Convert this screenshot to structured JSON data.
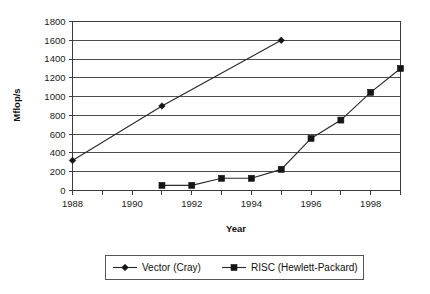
{
  "chart_data": {
    "type": "line",
    "title": "",
    "xlabel": "Year",
    "ylabel": "Mflop/s",
    "xlim": [
      1988,
      1999
    ],
    "ylim": [
      0,
      1800
    ],
    "ytick_step": 200,
    "xtick_step": 1,
    "x_tick_labels": [
      "1988",
      "1990",
      "1992",
      "1994",
      "1996",
      "1998"
    ],
    "x_tick_values": [
      1988,
      1990,
      1992,
      1994,
      1996,
      1998
    ],
    "y_tick_labels": [
      "0",
      "200",
      "400",
      "600",
      "800",
      "1000",
      "1200",
      "1400",
      "1600",
      "1800"
    ],
    "y_tick_values": [
      0,
      200,
      400,
      600,
      800,
      1000,
      1200,
      1400,
      1600,
      1800
    ],
    "grid": "horizontal",
    "legend_position": "bottom",
    "series": [
      {
        "name": "Vector (Cray)",
        "marker": "diamond",
        "color": "#151515",
        "points": [
          {
            "x": 1988,
            "y": 320
          },
          {
            "x": 1991,
            "y": 900
          },
          {
            "x": 1995,
            "y": 1600
          }
        ]
      },
      {
        "name": "RISC (Hewlett-Packard)",
        "marker": "square",
        "color": "#151515",
        "points": [
          {
            "x": 1991,
            "y": 55
          },
          {
            "x": 1992,
            "y": 55
          },
          {
            "x": 1993,
            "y": 130
          },
          {
            "x": 1994,
            "y": 130
          },
          {
            "x": 1995,
            "y": 225
          },
          {
            "x": 1996,
            "y": 555
          },
          {
            "x": 1997,
            "y": 750
          },
          {
            "x": 1998,
            "y": 1045
          },
          {
            "x": 1999,
            "y": 1300
          }
        ]
      }
    ]
  },
  "legend": {
    "entries": [
      {
        "label": "Vector (Cray)",
        "marker": "diamond"
      },
      {
        "label": "RISC (Hewlett-Packard)",
        "marker": "square"
      }
    ]
  },
  "axes": {
    "x_title": "Year",
    "y_title": "Mflop/s"
  }
}
